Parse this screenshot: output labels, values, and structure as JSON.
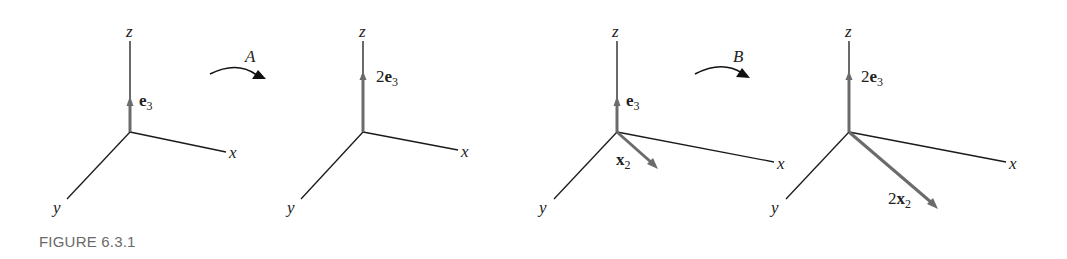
{
  "figure": {
    "caption": "FIGURE 6.3.1",
    "panels": [
      {
        "id": "panel-1",
        "axes": {
          "z": "z",
          "x": "x",
          "y": "y"
        },
        "vectors": [
          {
            "coef": "",
            "name": "e",
            "sub": "3",
            "direction": "z",
            "length": 1
          }
        ]
      },
      {
        "id": "panel-2",
        "axes": {
          "z": "z",
          "x": "x",
          "y": "y"
        },
        "vectors": [
          {
            "coef": "2",
            "name": "e",
            "sub": "3",
            "direction": "z",
            "length": 2
          }
        ]
      },
      {
        "id": "panel-3",
        "axes": {
          "z": "z",
          "x": "x",
          "y": "y"
        },
        "vectors": [
          {
            "coef": "",
            "name": "e",
            "sub": "3",
            "direction": "z",
            "length": 1
          },
          {
            "coef": "",
            "name": "x",
            "sub": "2",
            "direction": "xy-diagonal",
            "length": 1
          }
        ]
      },
      {
        "id": "panel-4",
        "axes": {
          "z": "z",
          "x": "x",
          "y": "y"
        },
        "vectors": [
          {
            "coef": "2",
            "name": "e",
            "sub": "3",
            "direction": "z",
            "length": 2
          },
          {
            "coef": "2",
            "name": "x",
            "sub": "2",
            "direction": "xy-diagonal",
            "length": 2
          }
        ]
      }
    ],
    "maps": [
      {
        "label": "A",
        "from": "panel-1",
        "to": "panel-2"
      },
      {
        "label": "B",
        "from": "panel-3",
        "to": "panel-4"
      }
    ],
    "colors": {
      "axis": "#1a1a1a",
      "vector": "#6b6b6b",
      "caption": "#6a6a6a"
    }
  }
}
